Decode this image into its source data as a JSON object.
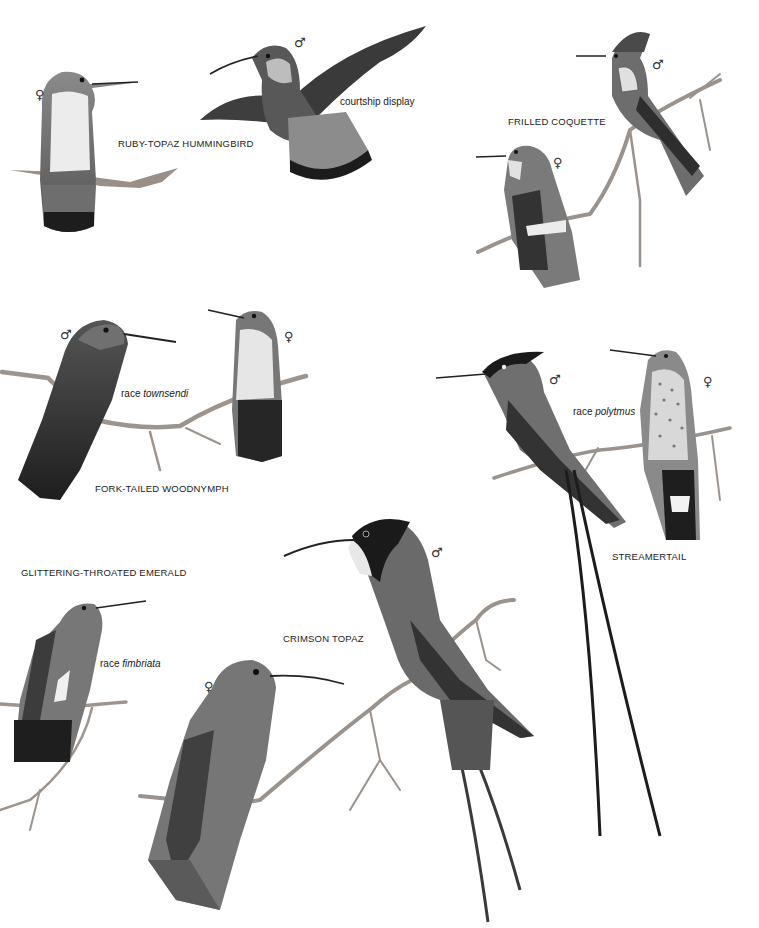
{
  "plate": {
    "species": [
      {
        "name": "RUBY-TOPAZ HUMMINGBIRD",
        "notes": [
          "courtship display"
        ],
        "figures": [
          {
            "sex": "♀",
            "pose": "perched"
          },
          {
            "sex": "♂",
            "pose": "courtship display"
          }
        ]
      },
      {
        "name": "FRILLED COQUETTE",
        "figures": [
          {
            "sex": "♂",
            "pose": "perched"
          },
          {
            "sex": "♀",
            "pose": "perched"
          }
        ]
      },
      {
        "name": "FORK-TAILED WOODNYMPH",
        "race_prefix": "race",
        "race": "townsendi",
        "figures": [
          {
            "sex": "♂",
            "pose": "perched"
          },
          {
            "sex": "♀",
            "pose": "perched"
          }
        ]
      },
      {
        "name": "STREAMERTAIL",
        "race_prefix": "race",
        "race": "polytmus",
        "figures": [
          {
            "sex": "♂",
            "pose": "perched"
          },
          {
            "sex": "♀",
            "pose": "perched"
          }
        ]
      },
      {
        "name": "GLITTERING-THROATED EMERALD",
        "race_prefix": "race",
        "race": "fimbriata",
        "figures": [
          {
            "sex": "",
            "pose": "perched"
          }
        ]
      },
      {
        "name": "CRIMSON TOPAZ",
        "figures": [
          {
            "sex": "♂",
            "pose": "perched"
          },
          {
            "sex": "♀",
            "pose": "perched"
          }
        ]
      }
    ]
  }
}
